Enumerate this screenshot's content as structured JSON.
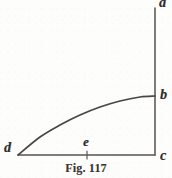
{
  "figure": {
    "caption": "Fig. 117",
    "background_color": "#fdfdfc",
    "ink_color": "#4a4644",
    "labels": {
      "a": "a",
      "b": "b",
      "c": "c",
      "d": "d",
      "e": "e"
    }
  },
  "chart_data": {
    "type": "line",
    "title": "Fig. 117",
    "subtitle": "",
    "xlabel": "",
    "ylabel": "",
    "grid": false,
    "legend": null,
    "xlim": [
      0,
      172
    ],
    "ylim": [
      0,
      178
    ],
    "annotations": [
      {
        "label": "a",
        "x": 155,
        "y": 8,
        "description": "top end of vertical axis"
      },
      {
        "label": "b",
        "x": 155,
        "y": 96,
        "description": "point where curve meets vertical axis"
      },
      {
        "label": "c",
        "x": 155,
        "y": 155,
        "description": "corner where vertical axis meets horizontal base line"
      },
      {
        "label": "d",
        "x": 18,
        "y": 155,
        "description": "left end of base line, start of curve"
      },
      {
        "label": "e",
        "x": 87,
        "y": 155,
        "description": "tick point on base line between d and c"
      }
    ],
    "series": [
      {
        "name": "vertical-axis-ac",
        "type": "line",
        "x": [
          155,
          155
        ],
        "y": [
          8,
          155
        ]
      },
      {
        "name": "base-line-dc",
        "type": "line",
        "x": [
          18,
          155
        ],
        "y": [
          155,
          155
        ]
      },
      {
        "name": "curve-db",
        "type": "curve",
        "x": [
          18,
          40,
          60,
          80,
          100,
          120,
          140,
          155
        ],
        "y": [
          155,
          137,
          125,
          115,
          107,
          101,
          97,
          96
        ]
      },
      {
        "name": "tick-at-e",
        "type": "line",
        "x": [
          87,
          87
        ],
        "y": [
          151,
          159
        ]
      }
    ]
  }
}
